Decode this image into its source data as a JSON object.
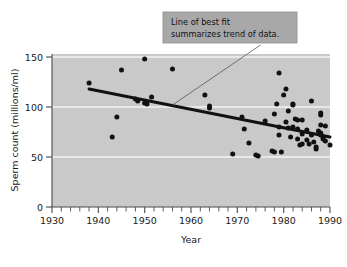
{
  "chart_data": {
    "type": "scatter",
    "title": "",
    "xlabel": "Year",
    "ylabel": "Sperm count (millions/ml)",
    "xlim": [
      1930,
      1990
    ],
    "ylim": [
      0,
      150
    ],
    "xticks": [
      1930,
      1940,
      1950,
      1960,
      1970,
      1980,
      1990
    ],
    "xtick_labels": [
      "1930",
      "1940",
      "1950",
      "1960",
      "1970",
      "1980",
      "1990"
    ],
    "yticks": [
      0,
      50,
      100,
      150
    ],
    "ytick_labels": [
      "0",
      "50",
      "100",
      "150"
    ],
    "minor_xtick_step": 2,
    "grid": "horizontal-white-on-gray",
    "legend": "none",
    "plot_background_color": "#c9c9c9",
    "point_color": "#111111",
    "line_color": "#111111",
    "points": [
      [
        1938,
        124
      ],
      [
        1943,
        70
      ],
      [
        1944,
        90
      ],
      [
        1945,
        137
      ],
      [
        1948,
        108
      ],
      [
        1948.5,
        106
      ],
      [
        1950,
        148
      ],
      [
        1950,
        104
      ],
      [
        1950.5,
        103
      ],
      [
        1951.5,
        110
      ],
      [
        1956,
        138
      ],
      [
        1963,
        112
      ],
      [
        1964,
        101
      ],
      [
        1964,
        99
      ],
      [
        1969,
        53
      ],
      [
        1971,
        90
      ],
      [
        1971.5,
        78
      ],
      [
        1972.5,
        64
      ],
      [
        1974,
        52
      ],
      [
        1974.5,
        51
      ],
      [
        1976,
        86
      ],
      [
        1977.5,
        56
      ],
      [
        1978,
        55
      ],
      [
        1978,
        93
      ],
      [
        1978.5,
        103
      ],
      [
        1979,
        134
      ],
      [
        1979,
        80
      ],
      [
        1979,
        72
      ],
      [
        1979.5,
        55
      ],
      [
        1980,
        112
      ],
      [
        1980.5,
        118
      ],
      [
        1980.5,
        85
      ],
      [
        1981,
        96
      ],
      [
        1981,
        79
      ],
      [
        1981.5,
        70
      ],
      [
        1982,
        103
      ],
      [
        1982,
        102
      ],
      [
        1982,
        80
      ],
      [
        1982.5,
        88
      ],
      [
        1983,
        87
      ],
      [
        1983,
        78
      ],
      [
        1983,
        68
      ],
      [
        1983.5,
        62
      ],
      [
        1984,
        87
      ],
      [
        1984,
        73
      ],
      [
        1984,
        63
      ],
      [
        1985,
        77
      ],
      [
        1985,
        67
      ],
      [
        1985.5,
        63
      ],
      [
        1986,
        106
      ],
      [
        1986,
        72
      ],
      [
        1986.5,
        65
      ],
      [
        1987,
        60
      ],
      [
        1987,
        58
      ],
      [
        1987.5,
        76
      ],
      [
        1988,
        94
      ],
      [
        1988,
        92
      ],
      [
        1988,
        82
      ],
      [
        1988,
        74
      ],
      [
        1988,
        73
      ],
      [
        1988,
        72
      ],
      [
        1988.5,
        70
      ],
      [
        1988.5,
        68
      ],
      [
        1989,
        81
      ],
      [
        1989,
        66
      ],
      [
        1990,
        62
      ]
    ],
    "fit_line": {
      "x_start": 1938,
      "y_start": 118,
      "x_end": 1990,
      "y_end": 70
    },
    "annotation": {
      "line1": "Line of best fit",
      "line2": "summarizes trend of data.",
      "leader_from": [
        1975,
        162
      ],
      "leader_to": [
        1956,
        102
      ]
    }
  }
}
